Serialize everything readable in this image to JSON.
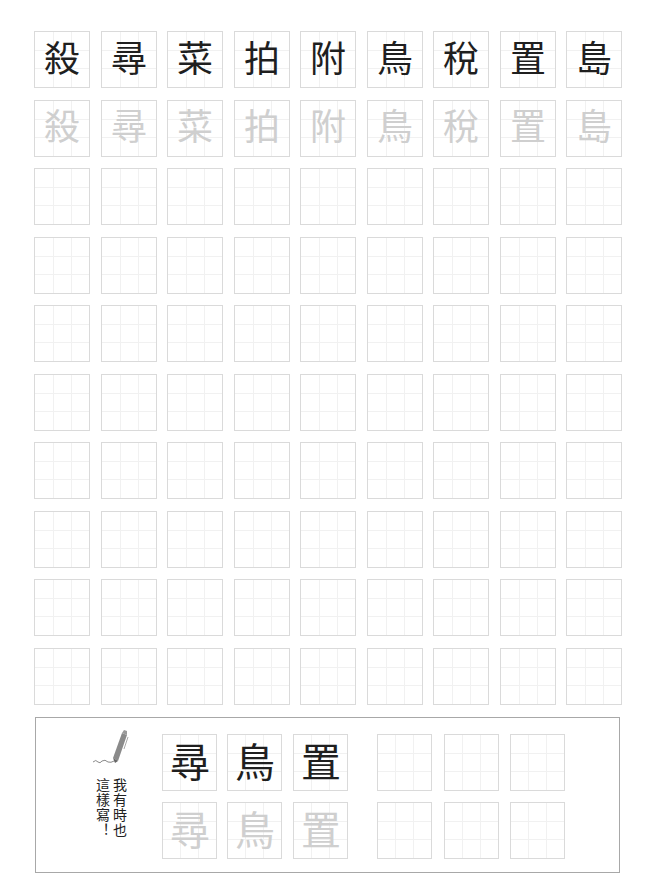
{
  "worksheet": {
    "model_row": [
      "殺",
      "尋",
      "菜",
      "拍",
      "附",
      "鳥",
      "稅",
      "置",
      "島"
    ],
    "trace_row": [
      "殺",
      "尋",
      "菜",
      "拍",
      "附",
      "鳥",
      "稅",
      "置",
      "島"
    ],
    "blank_rows": 8,
    "columns": 9
  },
  "variant_box": {
    "caption_lines": [
      "我有時也",
      "這樣寫！"
    ],
    "model_chars": [
      "尋",
      "鳥",
      "置"
    ],
    "trace_chars": [
      "尋",
      "鳥",
      "置"
    ],
    "blank_cells": 6
  },
  "icons": {
    "pen": "pen-icon"
  },
  "colors": {
    "model_text": "#1f1f1f",
    "trace_text": "#cfcfcf",
    "cell_border": "#dadada",
    "guide_line": "#f1f1f1",
    "box_border": "#a8a8a8",
    "pen": "#8a8a8a"
  }
}
